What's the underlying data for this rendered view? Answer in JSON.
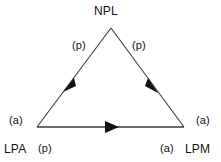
{
  "diagram": {
    "type": "directed-triangle-graph",
    "background_color": "#ffffff",
    "line_color": "#3c3c3c",
    "text_color": "#111111",
    "nodes": [
      {
        "id": "npl",
        "label": "NPL",
        "position": "apex"
      },
      {
        "id": "lpa",
        "label": "LPA",
        "position": "bottom-left"
      },
      {
        "id": "lpm",
        "label": "LPM",
        "position": "bottom-right"
      }
    ],
    "edges": [
      {
        "id": "npl-lpa",
        "from": "NPL",
        "to": "LPA",
        "label": "(p)",
        "direction": "down-left"
      },
      {
        "id": "npl-lpm",
        "from": "NPL",
        "to": "LPM",
        "label": "(p)",
        "direction": "down-right"
      },
      {
        "id": "lpa-lpm",
        "from": "LPA",
        "to": "LPM",
        "label": "",
        "direction": "right"
      }
    ],
    "vertex_marks": [
      {
        "id": "a-topleft",
        "label": "(a)",
        "near": "LPA",
        "placement": "above-left"
      },
      {
        "id": "a-topright",
        "label": "(a)",
        "near": "LPM",
        "placement": "above-right"
      },
      {
        "id": "p-bottom",
        "label": "(p)",
        "near": "LPA",
        "placement": "below-right"
      },
      {
        "id": "a-bottom",
        "label": "(a)",
        "near": "LPM",
        "placement": "below-left"
      }
    ]
  }
}
